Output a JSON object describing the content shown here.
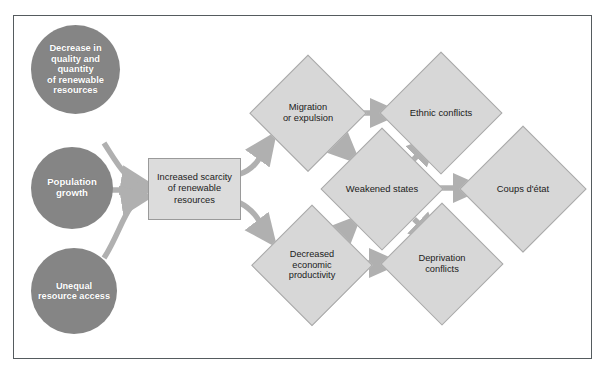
{
  "diagram": {
    "colors": {
      "circle_fill": "#858585",
      "circle_text": "#ffffff",
      "box_fill": "#dcdcdc",
      "diamond_fill": "#d7d7d7",
      "arrow": "#b0b0b0",
      "frame_border": "#555b5e",
      "page_background": "#ffffff"
    },
    "nodes": [
      {
        "id": "decrease-quality-quantity",
        "shape": "circle",
        "label": "Decrease in\nquality and\nquantity\nof renewable\nresources"
      },
      {
        "id": "population-growth",
        "shape": "circle",
        "label": "Population\ngrowth"
      },
      {
        "id": "unequal-resource-access",
        "shape": "circle",
        "label": "Unequal\nresource access"
      },
      {
        "id": "increased-scarcity",
        "shape": "rectangle",
        "label": "Increased scarcity\nof renewable\nresources"
      },
      {
        "id": "migration-or-expulsion",
        "shape": "diamond",
        "label": "Migration\nor expulsion"
      },
      {
        "id": "ethnic-conflicts",
        "shape": "diamond",
        "label": "Ethnic conflicts"
      },
      {
        "id": "weakened-states",
        "shape": "diamond",
        "label": "Weakened states"
      },
      {
        "id": "coups-detat",
        "shape": "diamond",
        "label": "Coups d'état"
      },
      {
        "id": "decreased-economic-productivity",
        "shape": "diamond",
        "label": "Decreased\neconomic\nproductivity"
      },
      {
        "id": "deprivation-conflicts",
        "shape": "diamond",
        "label": "Deprivation\nconflicts"
      }
    ],
    "edges": [
      {
        "from": "decrease-quality-quantity",
        "to": "increased-scarcity",
        "style": "curved"
      },
      {
        "from": "population-growth",
        "to": "increased-scarcity",
        "style": "straight"
      },
      {
        "from": "unequal-resource-access",
        "to": "increased-scarcity",
        "style": "curved"
      },
      {
        "from": "increased-scarcity",
        "to": "migration-or-expulsion",
        "style": "curved"
      },
      {
        "from": "increased-scarcity",
        "to": "decreased-economic-productivity",
        "style": "curved"
      },
      {
        "from": "migration-or-expulsion",
        "to": "ethnic-conflicts",
        "style": "straight"
      },
      {
        "from": "migration-or-expulsion",
        "to": "weakened-states",
        "style": "straight"
      },
      {
        "from": "decreased-economic-productivity",
        "to": "weakened-states",
        "style": "straight"
      },
      {
        "from": "decreased-economic-productivity",
        "to": "deprivation-conflicts",
        "style": "straight"
      },
      {
        "from": "weakened-states",
        "to": "ethnic-conflicts",
        "style": "straight"
      },
      {
        "from": "weakened-states",
        "to": "coups-detat",
        "style": "straight"
      },
      {
        "from": "weakened-states",
        "to": "deprivation-conflicts",
        "style": "straight"
      }
    ]
  }
}
